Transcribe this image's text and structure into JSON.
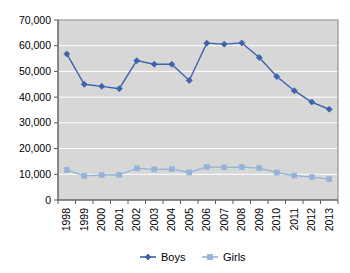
{
  "chart_data": {
    "type": "line",
    "title": "",
    "subtitle": "",
    "xlabel": "",
    "ylabel": "",
    "categories": [
      "1998",
      "1999",
      "2000",
      "2001",
      "2002",
      "2003",
      "2004",
      "2005",
      "2006",
      "2007",
      "2008",
      "2009",
      "2010",
      "2011",
      "2012",
      "2013"
    ],
    "series": [
      {
        "name": "Boys",
        "color": "#3d63ad",
        "marker": "diamond",
        "values": [
          56800,
          45000,
          44200,
          43300,
          54200,
          52800,
          52800,
          46500,
          61000,
          60600,
          61100,
          55400,
          48000,
          42500,
          38100,
          35300
        ]
      },
      {
        "name": "Girls",
        "color": "#95b3d7",
        "marker": "square",
        "values": [
          11700,
          9400,
          9700,
          9800,
          12300,
          11900,
          12000,
          10700,
          12900,
          12700,
          12800,
          12400,
          10700,
          9500,
          8900,
          8100
        ]
      }
    ],
    "ylim": [
      0,
      70000
    ],
    "ytick_values": [
      0,
      10000,
      20000,
      30000,
      40000,
      50000,
      60000,
      70000
    ],
    "ytick_labels": [
      "0",
      "10,000",
      "20,000",
      "30,000",
      "40,000",
      "50,000",
      "60,000",
      "70,000"
    ],
    "grid": true,
    "gridline_color": "#ffffff",
    "plot_background": "#d7d7d7",
    "legend_position": "bottom",
    "xtick_rotation": 90
  },
  "legend": {
    "items": [
      {
        "label": "Boys",
        "color": "#3d63ad"
      },
      {
        "label": "Girls",
        "color": "#95b3d7"
      }
    ]
  }
}
